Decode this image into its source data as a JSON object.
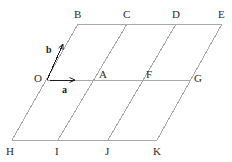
{
  "figure": {
    "type": "geometric-lattice-diagram",
    "background_color": "#ffffff",
    "line_color": "#a8a8a8",
    "line_width": 1,
    "label_color": "#2b2b2b",
    "vector_color": "#1d1d1d",
    "canvas": {
      "width": 232,
      "height": 162
    }
  },
  "points": [
    {
      "id": "B",
      "label": "B",
      "x": 78,
      "y": 24,
      "label_x": 74,
      "label_y": 9
    },
    {
      "id": "C",
      "label": "C",
      "x": 127,
      "y": 24,
      "label_x": 123,
      "label_y": 9
    },
    {
      "id": "D",
      "label": "D",
      "x": 176,
      "y": 24,
      "label_x": 172,
      "label_y": 9
    },
    {
      "id": "E",
      "label": "E",
      "x": 222,
      "y": 24,
      "label_x": 218,
      "label_y": 9
    },
    {
      "id": "O",
      "label": "O",
      "x": 47,
      "y": 80,
      "label_x": 34,
      "label_y": 73
    },
    {
      "id": "A",
      "label": "A",
      "x": 96,
      "y": 80,
      "label_x": 99,
      "label_y": 69
    },
    {
      "id": "F",
      "label": "F",
      "x": 143,
      "y": 80,
      "label_x": 146,
      "label_y": 69
    },
    {
      "id": "G",
      "label": "G",
      "x": 190,
      "y": 80,
      "label_x": 194,
      "label_y": 73
    },
    {
      "id": "H",
      "label": "H",
      "x": 12,
      "y": 140,
      "label_x": 6,
      "label_y": 146
    },
    {
      "id": "I",
      "label": "I",
      "x": 58,
      "y": 140,
      "label_x": 55,
      "label_y": 146
    },
    {
      "id": "J",
      "label": "J",
      "x": 108,
      "y": 140,
      "label_x": 105,
      "label_y": 146
    },
    {
      "id": "K",
      "label": "K",
      "x": 157,
      "y": 140,
      "label_x": 153,
      "label_y": 146
    }
  ],
  "horizontal_lines": [
    {
      "name": "top-row-line",
      "x1": 78,
      "y1": 24,
      "x2": 222,
      "y2": 24
    },
    {
      "name": "middle-row-line",
      "x1": 47,
      "y1": 80,
      "x2": 190,
      "y2": 80
    },
    {
      "name": "bottom-row-line",
      "x1": 12,
      "y1": 140,
      "x2": 157,
      "y2": 140
    }
  ],
  "slanted_lines": [
    {
      "name": "slant-H-O-B",
      "x1": 12,
      "y1": 140,
      "x2": 78,
      "y2": 24
    },
    {
      "name": "slant-I-A-C",
      "x1": 58,
      "y1": 140,
      "x2": 127,
      "y2": 24
    },
    {
      "name": "slant-J-F-D",
      "x1": 108,
      "y1": 140,
      "x2": 176,
      "y2": 24
    },
    {
      "name": "slant-K-G-E",
      "x1": 157,
      "y1": 140,
      "x2": 222,
      "y2": 24
    }
  ],
  "vectors": [
    {
      "id": "a",
      "label": "a",
      "origin_point": "O",
      "x1": 50,
      "y1": 80,
      "x2": 75,
      "y2": 80,
      "label_x": 62,
      "label_y": 85,
      "direction": "right"
    },
    {
      "id": "b",
      "label": "b",
      "origin_point": "O",
      "x1": 47,
      "y1": 80,
      "x2": 63,
      "y2": 44,
      "label_x": 46,
      "label_y": 45,
      "direction": "up-right"
    }
  ]
}
